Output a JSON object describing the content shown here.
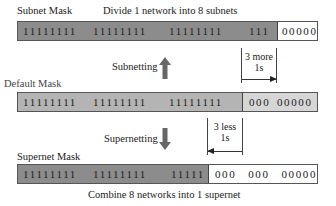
{
  "subnet": {
    "title": "Subnet Mask",
    "caption": "Divide 1 network into 8 subnets",
    "groups": [
      "11111111",
      "11111111",
      "11111111",
      "111",
      "00000"
    ]
  },
  "subnetting": {
    "label": "Subnetting",
    "direction": "up",
    "bracket_line1": "3 more",
    "bracket_line2": "1s"
  },
  "default": {
    "title": "Default Mask",
    "groups": [
      "11111111",
      "11111111",
      "11111111",
      "000",
      "00000"
    ]
  },
  "supernetting": {
    "label": "Supernetting",
    "direction": "down",
    "bracket_line1": "3 less",
    "bracket_line2": "1s"
  },
  "supernet": {
    "title": "Supernet Mask",
    "caption": "Combine 8 networks into 1 supernet",
    "groups": [
      "11111111",
      "11111111",
      "11111",
      "000",
      "000",
      "00000"
    ]
  },
  "colors": {
    "network_bits": "#8c8c8c",
    "default_host_bits": "#d6d6d6",
    "free_bits": "#ffffff",
    "arrow": "#666666"
  }
}
